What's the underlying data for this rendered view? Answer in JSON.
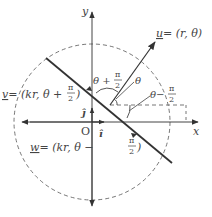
{
  "diagram": {
    "axes": {
      "x_label": "x",
      "y_label": "y",
      "origin_label": "O",
      "i_hat": "î",
      "j_hat": "ĵ"
    },
    "vectors": {
      "u": {
        "name": "u",
        "eq": "= (r, θ)"
      },
      "v": {
        "name": "v",
        "eq_left": "= (kr, θ + ",
        "frac_num": "π",
        "frac_den": "2",
        "eq_right": ")"
      },
      "w": {
        "name": "w",
        "eq_left": "= (kr, θ − ",
        "frac_num": "π",
        "frac_den": "2",
        "eq_right": ")"
      }
    },
    "angles": {
      "theta": "θ",
      "theta_plus_left": "θ + ",
      "theta_plus_num": "π",
      "theta_plus_den": "2",
      "theta_minus_left": "θ−",
      "theta_minus_num": "π",
      "theta_minus_den": "2"
    },
    "colors": {
      "line": "#333333",
      "axis": "#444444",
      "dashed": "#666666",
      "text": "#444444"
    }
  }
}
